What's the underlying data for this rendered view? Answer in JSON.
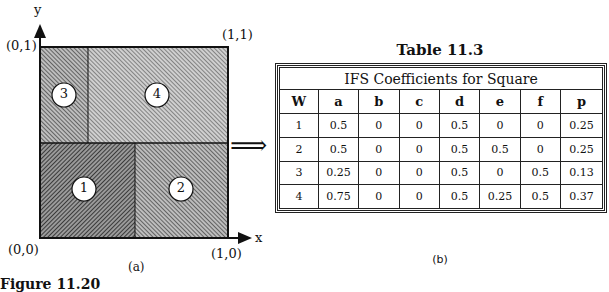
{
  "figure_a": {
    "axis_labels": {
      "y": "y",
      "x": "x"
    },
    "corner_labels": {
      "top_left": "(0,1)",
      "top_right": "(1,1)",
      "bottom_left": "(0,0)",
      "bottom_right": "(1,0)"
    },
    "regions": [
      {
        "id": "1",
        "label": "1"
      },
      {
        "id": "2",
        "label": "2"
      },
      {
        "id": "3",
        "label": "3"
      },
      {
        "id": "4",
        "label": "4"
      }
    ],
    "caption": "(a)",
    "arrow": "⟹"
  },
  "figure_label": "Figure 11.20",
  "table": {
    "title": "Table 11.3",
    "caption": "IFS Coefficients for Square",
    "columns": [
      "W",
      "a",
      "b",
      "c",
      "d",
      "e",
      "f",
      "p"
    ],
    "rows": [
      [
        "1",
        "0.5",
        "0",
        "0",
        "0.5",
        "0",
        "0",
        "0.25"
      ],
      [
        "2",
        "0.5",
        "0",
        "0",
        "0.5",
        "0.5",
        "0",
        "0.25"
      ],
      [
        "3",
        "0.25",
        "0",
        "0",
        "0.5",
        "0",
        "0.5",
        "0.13"
      ],
      [
        "4",
        "0.75",
        "0",
        "0",
        "0.5",
        "0.25",
        "0.5",
        "0.37"
      ]
    ]
  },
  "figure_b": {
    "caption": "(b)"
  }
}
